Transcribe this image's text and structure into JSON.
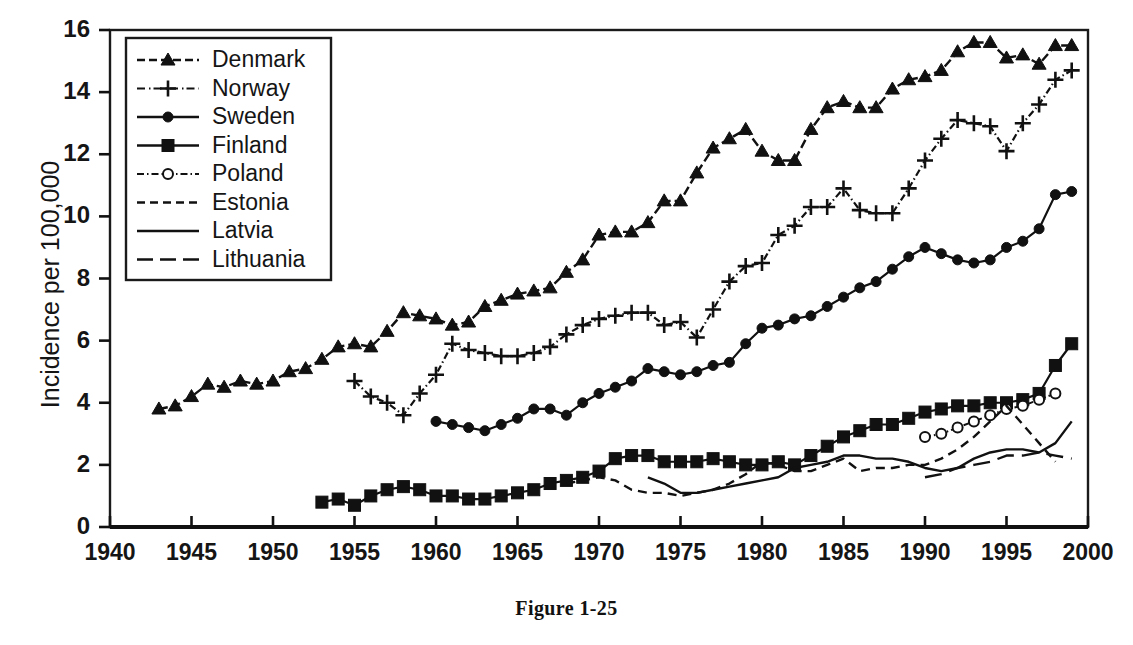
{
  "caption": "Figure 1-25",
  "axes": {
    "ylabel": "Incidence per 100,000",
    "xlabel": "",
    "yticks": [
      "0",
      "2",
      "4",
      "6",
      "8",
      "10",
      "12",
      "14",
      "16"
    ],
    "xticks": [
      "1940",
      "1945",
      "1950",
      "1955",
      "1960",
      "1965",
      "1970",
      "1975",
      "1980",
      "1985",
      "1990",
      "1995",
      "2000"
    ]
  },
  "legend": {
    "items": [
      {
        "label": "Denmark",
        "marker": "triangle",
        "dash": "dashed"
      },
      {
        "label": "Norway",
        "marker": "plus",
        "dash": "dash-dot"
      },
      {
        "label": "Sweden",
        "marker": "circle",
        "dash": "solid"
      },
      {
        "label": "Finland",
        "marker": "square",
        "dash": "solid-dot"
      },
      {
        "label": "Poland",
        "marker": "open-circle",
        "dash": "dash-dot"
      },
      {
        "label": "Estonia",
        "marker": "none",
        "dash": "dashed"
      },
      {
        "label": "Latvia",
        "marker": "none",
        "dash": "solid"
      },
      {
        "label": "Lithuania",
        "marker": "none",
        "dash": "long-dash"
      }
    ]
  },
  "chart_data": {
    "type": "line",
    "title": "",
    "subtitle": "",
    "xlabel": "",
    "ylabel": "Incidence per 100,000",
    "xlim": [
      1940,
      2000
    ],
    "ylim": [
      0,
      16
    ],
    "xtick_step": 5,
    "ytick_step": 2,
    "grid": false,
    "legend_position": "top-left",
    "series": [
      {
        "name": "Denmark",
        "marker": "triangle",
        "x": [
          1943,
          1944,
          1945,
          1946,
          1947,
          1948,
          1949,
          1950,
          1951,
          1952,
          1953,
          1954,
          1955,
          1956,
          1957,
          1958,
          1959,
          1960,
          1961,
          1962,
          1963,
          1964,
          1965,
          1966,
          1967,
          1968,
          1969,
          1970,
          1971,
          1972,
          1973,
          1974,
          1975,
          1976,
          1977,
          1978,
          1979,
          1980,
          1981,
          1982,
          1983,
          1984,
          1985,
          1986,
          1987,
          1988,
          1989,
          1990,
          1991,
          1992,
          1993,
          1994,
          1995,
          1996,
          1997,
          1998,
          1999
        ],
        "y": [
          3.8,
          3.9,
          4.2,
          4.6,
          4.5,
          4.7,
          4.6,
          4.7,
          5.0,
          5.1,
          5.4,
          5.8,
          5.9,
          5.8,
          6.3,
          6.9,
          6.8,
          6.7,
          6.5,
          6.6,
          7.1,
          7.3,
          7.5,
          7.6,
          7.7,
          8.2,
          8.6,
          9.4,
          9.5,
          9.5,
          9.8,
          10.5,
          10.5,
          11.4,
          12.2,
          12.5,
          12.8,
          12.1,
          11.8,
          11.8,
          12.8,
          13.5,
          13.7,
          13.5,
          13.5,
          14.1,
          14.4,
          14.5,
          14.7,
          15.3,
          15.6,
          15.6,
          15.1,
          15.2,
          14.9,
          15.5,
          15.5
        ]
      },
      {
        "name": "Norway",
        "marker": "plus",
        "x": [
          1955,
          1956,
          1957,
          1958,
          1959,
          1960,
          1961,
          1962,
          1963,
          1964,
          1965,
          1966,
          1967,
          1968,
          1969,
          1970,
          1971,
          1972,
          1973,
          1974,
          1975,
          1976,
          1977,
          1978,
          1979,
          1980,
          1981,
          1982,
          1983,
          1984,
          1985,
          1986,
          1987,
          1988,
          1989,
          1990,
          1991,
          1992,
          1993,
          1994,
          1995,
          1996,
          1997,
          1998,
          1999
        ],
        "y": [
          4.7,
          4.2,
          4.0,
          3.6,
          4.3,
          4.9,
          5.9,
          5.7,
          5.6,
          5.5,
          5.5,
          5.6,
          5.8,
          6.2,
          6.5,
          6.7,
          6.8,
          6.9,
          6.9,
          6.5,
          6.6,
          6.1,
          7.0,
          7.9,
          8.4,
          8.5,
          9.4,
          9.7,
          10.3,
          10.3,
          10.9,
          10.2,
          10.1,
          10.1,
          10.9,
          11.8,
          12.5,
          13.1,
          13.0,
          12.9,
          12.1,
          13.0,
          13.6,
          14.4,
          14.7
        ]
      },
      {
        "name": "Sweden",
        "marker": "circle",
        "x": [
          1960,
          1961,
          1962,
          1963,
          1964,
          1965,
          1966,
          1967,
          1968,
          1969,
          1970,
          1971,
          1972,
          1973,
          1974,
          1975,
          1976,
          1977,
          1978,
          1979,
          1980,
          1981,
          1982,
          1983,
          1984,
          1985,
          1986,
          1987,
          1988,
          1989,
          1990,
          1991,
          1992,
          1993,
          1994,
          1995,
          1996,
          1997,
          1998,
          1999
        ],
        "y": [
          3.4,
          3.3,
          3.2,
          3.1,
          3.3,
          3.5,
          3.8,
          3.8,
          3.6,
          4.0,
          4.3,
          4.5,
          4.7,
          5.1,
          5.0,
          4.9,
          5.0,
          5.2,
          5.3,
          5.9,
          6.4,
          6.5,
          6.7,
          6.8,
          7.1,
          7.4,
          7.7,
          7.9,
          8.3,
          8.7,
          9.0,
          8.8,
          8.6,
          8.5,
          8.6,
          9.0,
          9.2,
          9.6,
          10.7,
          10.8
        ]
      },
      {
        "name": "Finland",
        "marker": "square",
        "x": [
          1953,
          1954,
          1955,
          1956,
          1957,
          1958,
          1959,
          1960,
          1961,
          1962,
          1963,
          1964,
          1965,
          1966,
          1967,
          1968,
          1969,
          1970,
          1971,
          1972,
          1973,
          1974,
          1975,
          1976,
          1977,
          1978,
          1979,
          1980,
          1981,
          1982,
          1983,
          1984,
          1985,
          1986,
          1987,
          1988,
          1989,
          1990,
          1991,
          1992,
          1993,
          1994,
          1995,
          1996,
          1997,
          1998,
          1999
        ],
        "y": [
          0.8,
          0.9,
          0.7,
          1.0,
          1.2,
          1.3,
          1.2,
          1.0,
          1.0,
          0.9,
          0.9,
          1.0,
          1.1,
          1.2,
          1.4,
          1.5,
          1.6,
          1.8,
          2.2,
          2.3,
          2.3,
          2.1,
          2.1,
          2.1,
          2.2,
          2.1,
          2.0,
          2.0,
          2.1,
          2.0,
          2.3,
          2.6,
          2.9,
          3.1,
          3.3,
          3.3,
          3.5,
          3.7,
          3.8,
          3.9,
          3.9,
          4.0,
          4.0,
          4.1,
          4.3,
          5.2,
          5.9
        ]
      },
      {
        "name": "Poland",
        "marker": "open-circle",
        "x": [
          1990,
          1991,
          1992,
          1993,
          1994,
          1995,
          1996,
          1997,
          1998
        ],
        "y": [
          2.9,
          3.0,
          3.2,
          3.4,
          3.6,
          3.8,
          3.9,
          4.1,
          4.3
        ]
      },
      {
        "name": "Estonia",
        "marker": "none",
        "x": [
          1968,
          1969,
          1970,
          1971,
          1972,
          1973,
          1974,
          1975,
          1976,
          1977,
          1978,
          1979,
          1980,
          1981,
          1982,
          1983,
          1984,
          1985,
          1986,
          1987,
          1988,
          1989,
          1990,
          1991,
          1992,
          1993,
          1994,
          1995,
          1996,
          1997,
          1998
        ],
        "y": [
          1.4,
          1.5,
          1.6,
          1.5,
          1.2,
          1.1,
          1.1,
          1.0,
          1.1,
          1.2,
          1.4,
          1.7,
          2.1,
          2.0,
          1.8,
          1.8,
          2.0,
          2.2,
          1.8,
          1.9,
          1.9,
          2.0,
          2.0,
          2.2,
          2.5,
          2.9,
          3.4,
          3.9,
          3.3,
          2.7,
          2.1
        ]
      },
      {
        "name": "Latvia",
        "marker": "none",
        "x": [
          1973,
          1974,
          1975,
          1976,
          1977,
          1978,
          1979,
          1980,
          1981,
          1982,
          1983,
          1984,
          1985,
          1986,
          1987,
          1988,
          1989,
          1990,
          1991,
          1992,
          1993,
          1994,
          1995,
          1996,
          1997,
          1998,
          1999
        ],
        "y": [
          1.6,
          1.4,
          1.1,
          1.1,
          1.2,
          1.3,
          1.4,
          1.5,
          1.6,
          1.9,
          2.0,
          2.1,
          2.3,
          2.3,
          2.2,
          2.2,
          2.1,
          1.9,
          1.8,
          1.9,
          2.2,
          2.4,
          2.5,
          2.5,
          2.4,
          2.7,
          3.4
        ]
      },
      {
        "name": "Lithuania",
        "marker": "none",
        "x": [
          1990,
          1991,
          1992,
          1993,
          1994,
          1995,
          1996,
          1997,
          1998,
          1999
        ],
        "y": [
          1.6,
          1.7,
          1.9,
          2.0,
          2.1,
          2.3,
          2.3,
          2.4,
          2.3,
          2.2
        ]
      }
    ]
  }
}
